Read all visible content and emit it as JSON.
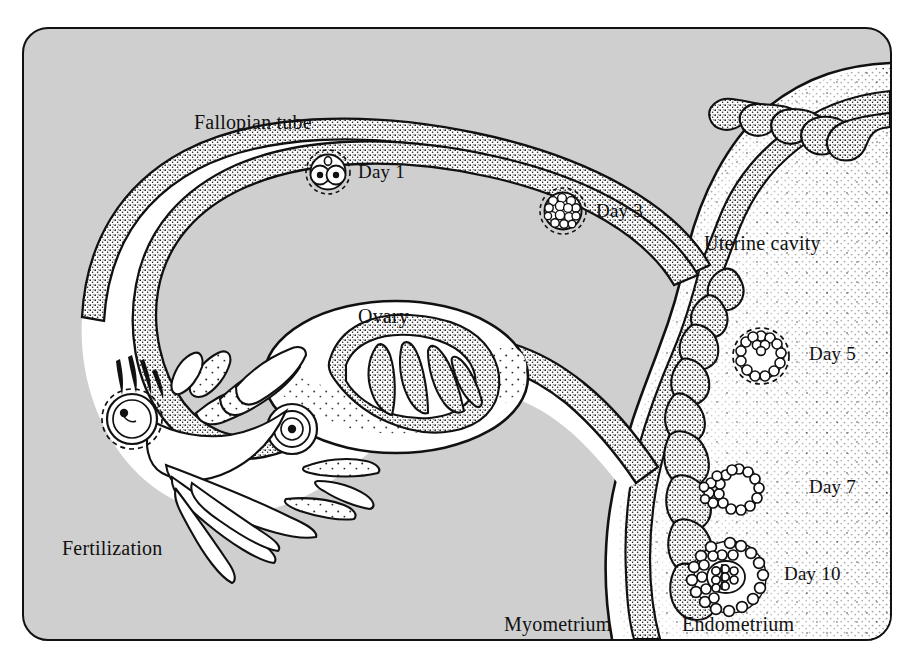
{
  "figure": {
    "frame": {
      "background_color": "#cfcfcf",
      "border_color": "#111111",
      "interior_color": "#ffffff"
    }
  },
  "labels": {
    "fallopian_tube": "Fallopian tube",
    "ovary": "Ovary",
    "fertilization": "Fertilization",
    "uterine_cavity": "Uterine cavity",
    "myometrium": "Myometrium",
    "endometrium": "Endometrium"
  },
  "stages": [
    {
      "id": "day1",
      "label": "Day 1",
      "description": "two-cell zygote with polar body inside zona pellucida"
    },
    {
      "id": "day3",
      "label": "Day 3",
      "description": "morula, solid ball of blastomeres in zona pellucida"
    },
    {
      "id": "day5",
      "label": "Day 5",
      "description": "blastocyst, hollow ring of cells in zona pellucida"
    },
    {
      "id": "day7",
      "label": "Day 7",
      "description": "blastocyst attaching to endometrium surface"
    },
    {
      "id": "day10",
      "label": "Day 10",
      "description": "implanted embryo embedded in endometrium"
    }
  ],
  "colors": {
    "background_gray": "#cfcfcf",
    "cavity_white": "#ffffff",
    "ink": "#111111",
    "stipple": "#2b2b2b"
  }
}
